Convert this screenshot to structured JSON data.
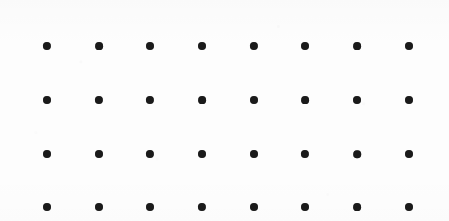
{
  "page": {
    "width": 449,
    "height": 221,
    "background_color": "#fdfdfd"
  },
  "grid": {
    "name": "dot-grid",
    "columns": 8,
    "rows_visible": 5,
    "rows_fully_visible": 4,
    "dot_color": "#1a1a1a",
    "dot_diameter": 8,
    "column_spacing": 51.7,
    "row_spacing": 53.7,
    "margin_left": 43,
    "margin_right": 36,
    "margin_bottom": 14,
    "column_centers_x": [
      47,
      99,
      150,
      202,
      254,
      305,
      357,
      409
    ],
    "row_centers_y": [
      -6,
      46,
      100,
      154,
      207
    ],
    "rows": [
      {
        "index": 0,
        "label": "row-0-clipped",
        "center_y": -6,
        "clipped": true,
        "dots": [
          {
            "col": 0,
            "x": 47,
            "y": -6,
            "d": 8
          },
          {
            "col": 1,
            "x": 99,
            "y": -6,
            "d": 8
          },
          {
            "col": 2,
            "x": 150,
            "y": -6,
            "d": 8
          },
          {
            "col": 3,
            "x": 202,
            "y": -6,
            "d": 8
          },
          {
            "col": 4,
            "x": 254,
            "y": -6,
            "d": 8
          },
          {
            "col": 5,
            "x": 305,
            "y": -6,
            "d": 8
          },
          {
            "col": 6,
            "x": 357,
            "y": -6,
            "d": 8
          },
          {
            "col": 7,
            "x": 409,
            "y": -6,
            "d": 8
          }
        ]
      },
      {
        "index": 1,
        "label": "row-1",
        "center_y": 46,
        "clipped": false,
        "dots": [
          {
            "col": 0,
            "x": 47,
            "y": 46,
            "d": 8.2
          },
          {
            "col": 1,
            "x": 99,
            "y": 46,
            "d": 7.8
          },
          {
            "col": 2,
            "x": 150,
            "y": 46,
            "d": 8.0
          },
          {
            "col": 3,
            "x": 202,
            "y": 46,
            "d": 8.0
          },
          {
            "col": 4,
            "x": 254,
            "y": 46,
            "d": 8.2
          },
          {
            "col": 5,
            "x": 305,
            "y": 46,
            "d": 8.0
          },
          {
            "col": 6,
            "x": 357,
            "y": 46,
            "d": 7.8
          },
          {
            "col": 7,
            "x": 409,
            "y": 46,
            "d": 8.0
          }
        ]
      },
      {
        "index": 2,
        "label": "row-2",
        "center_y": 100,
        "clipped": false,
        "dots": [
          {
            "col": 0,
            "x": 47,
            "y": 100,
            "d": 8.0
          },
          {
            "col": 1,
            "x": 99,
            "y": 100,
            "d": 8.2
          },
          {
            "col": 2,
            "x": 150,
            "y": 100,
            "d": 8.2
          },
          {
            "col": 3,
            "x": 202,
            "y": 100,
            "d": 7.8
          },
          {
            "col": 4,
            "x": 254,
            "y": 100,
            "d": 8.0
          },
          {
            "col": 5,
            "x": 305,
            "y": 100,
            "d": 7.8
          },
          {
            "col": 6,
            "x": 357,
            "y": 100,
            "d": 8.0
          },
          {
            "col": 7,
            "x": 409,
            "y": 100,
            "d": 8.0
          }
        ]
      },
      {
        "index": 3,
        "label": "row-3",
        "center_y": 154,
        "clipped": false,
        "dots": [
          {
            "col": 0,
            "x": 47,
            "y": 154,
            "d": 8.0
          },
          {
            "col": 1,
            "x": 99,
            "y": 154,
            "d": 8.0
          },
          {
            "col": 2,
            "x": 150,
            "y": 154,
            "d": 8.2
          },
          {
            "col": 3,
            "x": 202,
            "y": 154,
            "d": 8.0
          },
          {
            "col": 4,
            "x": 254,
            "y": 154,
            "d": 8.0
          },
          {
            "col": 5,
            "x": 305,
            "y": 154,
            "d": 8.2
          },
          {
            "col": 6,
            "x": 357,
            "y": 154,
            "d": 7.6
          },
          {
            "col": 7,
            "x": 409,
            "y": 154,
            "d": 8.0
          }
        ]
      },
      {
        "index": 4,
        "label": "row-4",
        "center_y": 207,
        "clipped": false,
        "dots": [
          {
            "col": 0,
            "x": 47,
            "y": 207,
            "d": 8.0
          },
          {
            "col": 1,
            "x": 99,
            "y": 207,
            "d": 8.0
          },
          {
            "col": 2,
            "x": 150,
            "y": 207,
            "d": 8.0
          },
          {
            "col": 3,
            "x": 202,
            "y": 207,
            "d": 8.2
          },
          {
            "col": 4,
            "x": 254,
            "y": 207,
            "d": 8.0
          },
          {
            "col": 5,
            "x": 305,
            "y": 207,
            "d": 8.0
          },
          {
            "col": 6,
            "x": 357,
            "y": 207,
            "d": 7.8
          },
          {
            "col": 7,
            "x": 409,
            "y": 207,
            "d": 8.0
          }
        ]
      }
    ]
  }
}
